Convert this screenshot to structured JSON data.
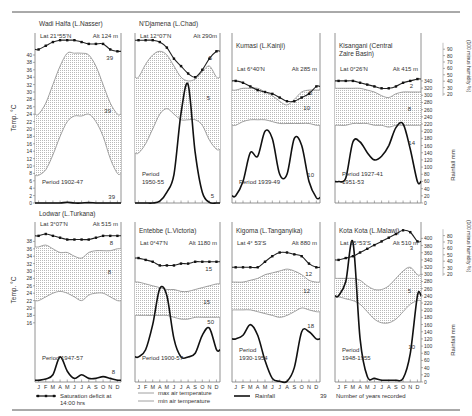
{
  "chart_data": {
    "type": "line",
    "months": [
      "J",
      "F",
      "M",
      "A",
      "M",
      "J",
      "J",
      "A",
      "S",
      "O",
      "N",
      "D"
    ],
    "axes": {
      "temperature": {
        "label": "Temp. °C",
        "top_ticks": [
          0,
          2,
          4,
          6,
          8,
          10,
          12,
          14,
          16,
          18,
          20,
          22,
          24,
          26,
          28,
          30,
          32,
          34,
          36,
          38,
          40
        ],
        "bottom_ticks": [
          16,
          18,
          20,
          22,
          24,
          26,
          28,
          30,
          32,
          34,
          36,
          38
        ]
      },
      "rainfall": {
        "label": "Rainfall mm",
        "top_ticks": [
          0,
          20,
          40,
          60,
          80,
          100,
          120,
          140,
          160,
          180,
          200,
          220,
          240,
          260,
          280,
          300,
          320,
          340
        ],
        "bottom_ticks": [
          0,
          20,
          40,
          60,
          80,
          100,
          120,
          140,
          160,
          180,
          200,
          220,
          240,
          260,
          280,
          300,
          320,
          340,
          360,
          380,
          400
        ]
      },
      "humidity": {
        "label": "(100 minus humidity %)",
        "top_ticks": [
          20,
          30,
          40,
          50,
          60,
          70,
          80,
          90
        ],
        "bottom_ticks": [
          20,
          30,
          40,
          50,
          60,
          70,
          80
        ]
      }
    },
    "legend": [
      {
        "key": "sat",
        "label": "Saturation deficit at 14:00 hrs"
      },
      {
        "key": "max",
        "label": "max air temperature"
      },
      {
        "key": "min",
        "label": "min air temperature"
      },
      {
        "key": "rain",
        "label": "Rainfall"
      },
      {
        "key": "years",
        "symbol": "39",
        "label": "Number of years recorded"
      }
    ],
    "panels": [
      {
        "name": "Wadi Halfa (L.Nasser)",
        "lat": "Lat  21°55'N",
        "alt": "Alt 124 m",
        "period": "Period  1902-47",
        "sat": [
          41.5,
          42.5,
          43.5,
          44,
          44,
          44,
          43.5,
          43,
          43,
          43,
          41.5,
          41
        ],
        "max": [
          24,
          27,
          32,
          37,
          40.5,
          40.5,
          40.5,
          40,
          37,
          32,
          27,
          24
        ],
        "min": [
          7.5,
          9,
          13,
          18,
          22,
          23.5,
          23.5,
          24,
          22,
          18,
          12,
          8
        ],
        "rain": [
          0,
          0,
          0,
          0,
          2,
          0,
          0,
          1,
          0,
          0,
          0,
          0
        ],
        "years": {
          "sat": "39",
          "temp": "39",
          "rain": "39"
        }
      },
      {
        "name": "N'Djamena (L.Chad)",
        "lat": "Lat 12°07'N",
        "alt": "Alt 290m",
        "period": "Period\n1950-55",
        "sat": [
          44,
          44,
          44,
          43.5,
          42,
          39,
          37,
          35,
          34,
          36,
          39,
          41
        ],
        "max": [
          34,
          37.5,
          40,
          41,
          40,
          37,
          34,
          33,
          33.5,
          35.5,
          37,
          34
        ],
        "min": [
          13.5,
          16,
          20,
          24,
          25.5,
          24,
          22.5,
          22.5,
          22.5,
          21,
          17,
          14.5
        ],
        "rain": [
          0,
          0,
          0,
          5,
          30,
          80,
          250,
          330,
          140,
          30,
          2,
          0
        ],
        "years": {
          "sat": "5",
          "temp": "5",
          "rain": "5"
        }
      },
      {
        "name": "Kumasi  (L.Kainji)",
        "lat": "Lat 6°40'N",
        "alt": "Alt 285 m",
        "period": "Period 1939-49",
        "sat": [
          33,
          32.5,
          31.5,
          30.5,
          30,
          29.5,
          28.5,
          27.5,
          27.5,
          28.5,
          29.5,
          31.5
        ],
        "max": [
          30.5,
          31,
          31,
          31,
          30,
          29,
          27.5,
          26.5,
          28,
          30,
          30.5,
          30.5
        ],
        "min": [
          21,
          22,
          22.5,
          22.5,
          22.5,
          22,
          21.5,
          21.5,
          21.5,
          21.5,
          21.5,
          21
        ],
        "rain": [
          20,
          60,
          140,
          130,
          200,
          180,
          80,
          80,
          180,
          160,
          60,
          15
        ],
        "years": {
          "sat": "5",
          "temp": "10",
          "rain": "10"
        }
      },
      {
        "name": "Kisangani (Central\nZaire Basin)",
        "lat": "Lat 0°26'N",
        "alt": "Alt 415 m",
        "period": "Period 1927-41\n1951-53",
        "sat": [
          33,
          33,
          33,
          32.5,
          32,
          31.5,
          31,
          31,
          31.5,
          32.5,
          33,
          33.5
        ],
        "max": [
          31,
          31,
          31,
          31,
          30.5,
          30,
          29,
          28.5,
          29.5,
          30,
          30,
          30
        ],
        "min": [
          21,
          21,
          21.5,
          21.5,
          21.5,
          21,
          21,
          20.5,
          21,
          21,
          21,
          21
        ],
        "rain": [
          60,
          70,
          170,
          170,
          140,
          120,
          130,
          160,
          210,
          220,
          150,
          60
        ],
        "years": {
          "sat": "2",
          "temp": "8",
          "rain": "14"
        }
      },
      {
        "name": "Lodwar (L.Turkana)",
        "lat": "Lat 3°07'N",
        "alt": "Alt 515 m",
        "period": "Period 1947-57",
        "sat": [
          39.5,
          40,
          39.5,
          39,
          38.5,
          38.5,
          38.5,
          38.5,
          39,
          39.5,
          39.5,
          39.5
        ],
        "max": [
          36.5,
          37,
          36,
          35,
          35,
          34,
          33.5,
          35,
          35.5,
          35.5,
          35.5,
          36
        ],
        "min": [
          22,
          23,
          24,
          24.5,
          24,
          23,
          22,
          23.5,
          24,
          24,
          23,
          22
        ],
        "rain": [
          5,
          8,
          20,
          70,
          30,
          10,
          20,
          10,
          10,
          15,
          10,
          5
        ],
        "years": {
          "sat": "8",
          "temp": "8",
          "rain": "8"
        }
      },
      {
        "name": "Entebbe (L.Victoria)",
        "lat": "Lat 0°47'N",
        "alt": "Alt 1180 m",
        "period": "Period 1900-57",
        "sat": [
          33.5,
          33,
          32.5,
          31.5,
          31.5,
          31.5,
          32,
          32,
          32.5,
          32.5,
          32.5,
          32.5
        ],
        "max": [
          27,
          26.5,
          26,
          25.5,
          25,
          25,
          24.5,
          24.5,
          25,
          25.5,
          26,
          26.5
        ],
        "min": [
          18,
          18,
          18,
          18,
          18,
          17.5,
          17,
          17,
          17.5,
          17.5,
          17.5,
          17.5
        ],
        "rain": [
          70,
          90,
          160,
          260,
          240,
          120,
          70,
          70,
          80,
          130,
          150,
          90
        ],
        "years": {
          "sat": "15",
          "temp": "15",
          "rain": "50"
        }
      },
      {
        "name": "Kigoma (L.Tanganyika)",
        "lat": "Lat 4° 53'S",
        "alt": "Alt 880 m",
        "period": "Period\n1930-1954",
        "sat": [
          31,
          31,
          31,
          31,
          32.5,
          34,
          35,
          35,
          34.5,
          34,
          32,
          31
        ],
        "max": [
          27,
          27,
          27.5,
          28,
          29,
          29.5,
          30,
          30.5,
          30,
          29,
          27.5,
          27
        ],
        "min": [
          19.5,
          19.5,
          19.5,
          19,
          18.5,
          18,
          17.5,
          18,
          19,
          20,
          19.5,
          19
        ],
        "rain": [
          120,
          130,
          160,
          130,
          60,
          10,
          2,
          2,
          40,
          140,
          140,
          120
        ],
        "years": {
          "sat": "12",
          "temp": "12",
          "rain": "18"
        }
      },
      {
        "name": "Kota Kota (L.Malawi)",
        "lat": "Lat 15°53'S",
        "alt": "Alt 510 m",
        "period": "Period\n1948-1955",
        "sat": [
          33,
          33.5,
          34,
          35,
          36,
          37,
          38,
          39,
          40,
          41,
          40.5,
          38
        ],
        "max": [
          28,
          28,
          28,
          27.5,
          26,
          25,
          25,
          26,
          28,
          30,
          31,
          29
        ],
        "min": [
          23,
          22.5,
          22,
          21,
          19,
          17,
          16,
          16,
          17,
          19,
          21,
          22
        ],
        "rain": [
          240,
          280,
          390,
          120,
          15,
          10,
          5,
          5,
          5,
          10,
          80,
          240
        ],
        "years": {
          "sat": "3",
          "temp": "5",
          "rain": "10"
        }
      }
    ]
  }
}
